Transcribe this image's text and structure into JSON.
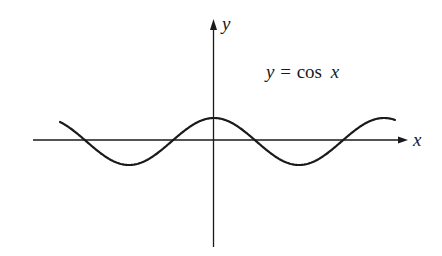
{
  "figure": {
    "equation_label": {
      "lhs": "y",
      "eq": "=",
      "fn": "cos",
      "arg": "x"
    },
    "x_axis_label": "x",
    "y_axis_label": "y",
    "colors": {
      "ink": "#1a1a1a",
      "background": "#ffffff"
    }
  },
  "chart_data": {
    "type": "line",
    "title": "y = cos x",
    "xlabel": "x",
    "ylabel": "y",
    "function": "cos",
    "grid": false,
    "ticks": false,
    "domain_periods_shown": [
      -1.8,
      1.07
    ],
    "features": {
      "peak_at_origin": true,
      "zero_crossings_visible": 4,
      "troughs_visible": 2
    }
  }
}
